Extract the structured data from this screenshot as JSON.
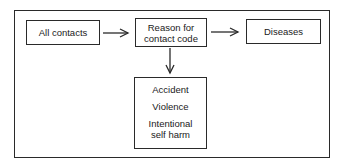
{
  "diagram": {
    "nodes": [
      {
        "id": "all_contacts",
        "label": "All contacts"
      },
      {
        "id": "reason_code",
        "label": "Reason for contact code",
        "lines": [
          "Reason for",
          "contact code"
        ]
      },
      {
        "id": "diseases",
        "label": "Diseases"
      },
      {
        "id": "external_causes",
        "items": [
          "Accident",
          "Violence",
          "Intentional self harm"
        ],
        "item_lines": [
          [
            "Accident"
          ],
          [
            "Violence"
          ],
          [
            "Intentional",
            "self harm"
          ]
        ]
      }
    ],
    "edges": [
      {
        "from": "all_contacts",
        "to": "reason_code"
      },
      {
        "from": "reason_code",
        "to": "diseases"
      },
      {
        "from": "reason_code",
        "to": "external_causes"
      }
    ],
    "colors": {
      "line": "#2a2a2a",
      "text": "#1a1a1a",
      "background": "#ffffff"
    }
  }
}
